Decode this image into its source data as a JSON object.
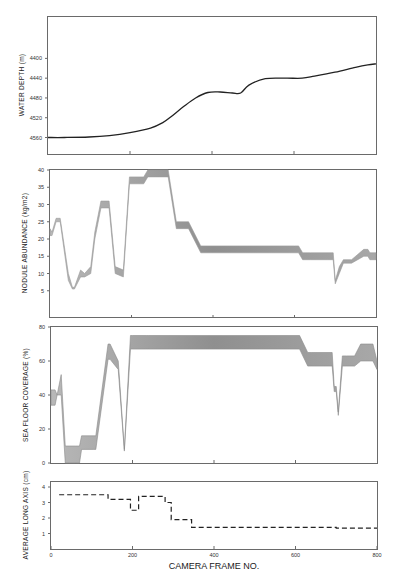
{
  "figure": {
    "xlabel": "CAMERA FRAME NO.",
    "x_ticks": [
      0,
      200,
      400,
      600,
      800
    ],
    "x_range": [
      0,
      800
    ]
  },
  "chart_data": [
    {
      "type": "line",
      "id": "water_depth",
      "title": "",
      "ylabel": "WATER DEPTH (m)",
      "xlabel": "",
      "ylim": [
        4590,
        4330
      ],
      "y_inverted": true,
      "y_ticks": [
        4400,
        4440,
        4480,
        4520,
        4560
      ],
      "grid": false,
      "x": [
        0,
        40,
        100,
        150,
        200,
        250,
        280,
        300,
        330,
        360,
        390,
        420,
        450,
        470,
        490,
        530,
        580,
        620,
        650,
        700,
        750,
        780,
        800
      ],
      "values": [
        4560,
        4560,
        4559,
        4556,
        4550,
        4541,
        4530,
        4518,
        4498,
        4480,
        4469,
        4468,
        4470,
        4470,
        4454,
        4441,
        4440,
        4440,
        4436,
        4428,
        4418,
        4413,
        4411
      ]
    },
    {
      "type": "area",
      "id": "nodule_abundance",
      "title": "",
      "ylabel": "NODULE ABUNDANCE (kg/m2)",
      "xlabel": "",
      "ylim": [
        0,
        40
      ],
      "y_ticks": [
        5,
        10,
        15,
        20,
        25,
        30,
        35,
        40
      ],
      "grid": false,
      "note": "shaded band between upper and lower values",
      "x": [
        0,
        5,
        15,
        25,
        45,
        55,
        60,
        75,
        85,
        100,
        110,
        125,
        145,
        160,
        180,
        195,
        230,
        240,
        290,
        310,
        340,
        370,
        600,
        610,
        620,
        640,
        680,
        695,
        700,
        710,
        720,
        740,
        770,
        780,
        785,
        800
      ],
      "upper": [
        23,
        22,
        26,
        26,
        10,
        6,
        6,
        11,
        10,
        12,
        22,
        31,
        31,
        12,
        11,
        38,
        38,
        40,
        40,
        25,
        25,
        18,
        18,
        18,
        16,
        16,
        16,
        16,
        8,
        12,
        14,
        14,
        17,
        17,
        16,
        16
      ],
      "lower": [
        21,
        21,
        25,
        25,
        8,
        5.5,
        5.5,
        9,
        9,
        10,
        20,
        29,
        29,
        10,
        9,
        36,
        36,
        38,
        38,
        23,
        23,
        16,
        16,
        16,
        14,
        14,
        14,
        14,
        7,
        10,
        13,
        13,
        15,
        15,
        14,
        14
      ]
    },
    {
      "type": "area",
      "id": "sea_floor_coverage",
      "title": "",
      "ylabel": "SEA FLOOR COVERAGE (%)",
      "xlabel": "",
      "ylim": [
        0,
        80
      ],
      "y_ticks": [
        0,
        20,
        40,
        60,
        80
      ],
      "grid": false,
      "note": "shaded band between upper and lower values",
      "x": [
        0,
        10,
        15,
        25,
        35,
        60,
        70,
        75,
        105,
        110,
        140,
        145,
        165,
        180,
        195,
        200,
        235,
        240,
        610,
        630,
        640,
        670,
        690,
        695,
        700,
        705,
        715,
        725,
        745,
        760,
        790,
        800
      ],
      "upper": [
        43,
        43,
        40,
        52,
        10,
        10,
        10,
        16,
        16,
        16,
        70,
        70,
        60,
        8,
        75,
        75,
        75,
        75,
        75,
        65,
        65,
        65,
        65,
        45,
        45,
        30,
        63,
        63,
        63,
        70,
        70,
        60
      ],
      "lower": [
        34,
        34,
        40,
        40,
        0,
        0,
        0,
        8,
        8,
        8,
        61,
        61,
        55,
        7,
        67,
        67,
        67,
        67,
        67,
        57,
        57,
        57,
        57,
        42,
        42,
        28,
        57,
        57,
        57,
        60,
        60,
        55
      ]
    },
    {
      "type": "line",
      "id": "average_long_axis",
      "style": "dashed-step",
      "title": "",
      "ylabel": "AVERAGE LONG AXIS (cm)",
      "xlabel": "CAMERA FRAME NO.",
      "ylim": [
        0,
        4
      ],
      "y_ticks": [
        1,
        2,
        3,
        4
      ],
      "grid": false,
      "x": [
        20,
        140,
        195,
        215,
        280,
        295,
        345,
        700,
        800
      ],
      "values": [
        3.5,
        3.2,
        2.5,
        3.4,
        3.0,
        1.9,
        1.4,
        1.35,
        1.35
      ]
    }
  ]
}
